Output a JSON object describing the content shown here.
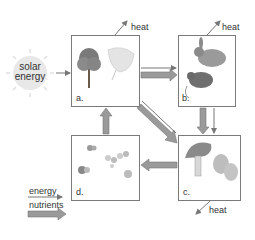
{
  "diagram": {
    "type": "ecosystem energy and nutrient flow",
    "source": {
      "label_line1": "solar",
      "label_line2": "energy",
      "icon": "sun-icon"
    },
    "boxes": [
      {
        "id": "a",
        "label": "a.",
        "contents": [
          "tree-icon",
          "leaf-icon"
        ],
        "role": "producers"
      },
      {
        "id": "b",
        "label": "b.",
        "contents": [
          "rabbit-icon",
          "rat-icon"
        ],
        "role": "consumers"
      },
      {
        "id": "c",
        "label": "c.",
        "contents": [
          "mushroom-icon",
          "bacteria-icon"
        ],
        "role": "decomposers"
      },
      {
        "id": "d",
        "label": "d.",
        "contents": [
          "molecule-icon"
        ],
        "role": "nutrients"
      }
    ],
    "heat_labels": [
      "heat",
      "heat",
      "heat"
    ],
    "legend": {
      "energy": "energy",
      "nutrients": "nutrients"
    },
    "colors": {
      "thin_arrow": "#777777",
      "thick_arrow": "#9a9a9a",
      "border": "#7a7a7a",
      "sun": "#e6e6e6"
    }
  }
}
